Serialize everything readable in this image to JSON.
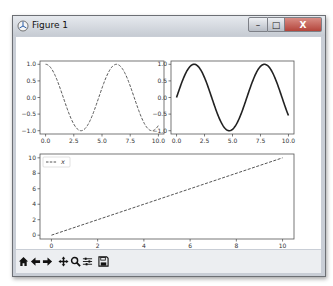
{
  "window": {
    "title": "Figure 1",
    "buttons": {
      "minimize": "–",
      "maximize": "□",
      "close": "X"
    }
  },
  "toolbar": {
    "items": [
      {
        "name": "home",
        "icon": "home-icon"
      },
      {
        "name": "back",
        "icon": "arrow-left-icon"
      },
      {
        "name": "forward",
        "icon": "arrow-right-icon"
      },
      {
        "name": "pan",
        "icon": "move-icon"
      },
      {
        "name": "zoom",
        "icon": "magnifier-icon"
      },
      {
        "name": "configure-subplots",
        "icon": "sliders-icon"
      },
      {
        "name": "save",
        "icon": "floppy-disk-icon"
      }
    ]
  },
  "chart_data": [
    {
      "type": "line",
      "title": "",
      "function": "cos(x)",
      "line_style": "dashed",
      "x_range": [
        0,
        10
      ],
      "xticks": [
        "0.0",
        "2.5",
        "5.0",
        "7.5",
        "10.0"
      ],
      "yticks": [
        "1.0",
        "0.5",
        "0.0",
        "-0.5",
        "-1.0"
      ],
      "ylim": [
        -1.0,
        1.0
      ],
      "grid": false
    },
    {
      "type": "line",
      "title": "",
      "function": "sin(x)",
      "line_style": "solid",
      "x_range": [
        0,
        10
      ],
      "xticks": [
        "0.0",
        "2.5",
        "5.0",
        "7.5",
        "10.0"
      ],
      "yticks": [
        "1.0",
        "0.5",
        "0.0",
        "-0.5",
        "-1.0"
      ],
      "ylim": [
        -1.0,
        1.0
      ],
      "grid": false
    },
    {
      "type": "line",
      "title": "",
      "series": [
        {
          "name": "x",
          "x": [
            0,
            10
          ],
          "values": [
            0,
            10
          ],
          "line_style": "dashed"
        }
      ],
      "xticks": [
        "0",
        "2",
        "4",
        "6",
        "8",
        "10"
      ],
      "yticks": [
        "10",
        "8",
        "6",
        "4",
        "2",
        "0"
      ],
      "xlim": [
        0,
        10
      ],
      "ylim": [
        0,
        10
      ],
      "legend": {
        "position": "upper left",
        "entries": [
          "x"
        ]
      },
      "grid": false
    }
  ]
}
